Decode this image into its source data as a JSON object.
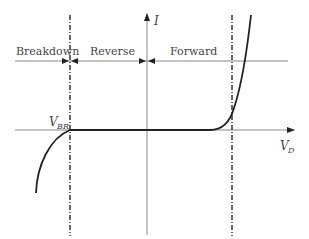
{
  "diagram": {
    "type": "diode-iv-characteristic",
    "regions": [
      {
        "id": "breakdown",
        "label": "Breakdown"
      },
      {
        "id": "reverse",
        "label": "Reverse"
      },
      {
        "id": "forward",
        "label": "Forward"
      }
    ],
    "axes": {
      "y_label": "I",
      "x_label_main": "V",
      "x_label_sub": "D"
    },
    "annotations": {
      "breakdown_voltage_main": "V",
      "breakdown_voltage_sub": "BR"
    },
    "colors": {
      "curve": "#222222",
      "axis": "#888888",
      "dashed": "#333333",
      "text": "#444444"
    }
  }
}
